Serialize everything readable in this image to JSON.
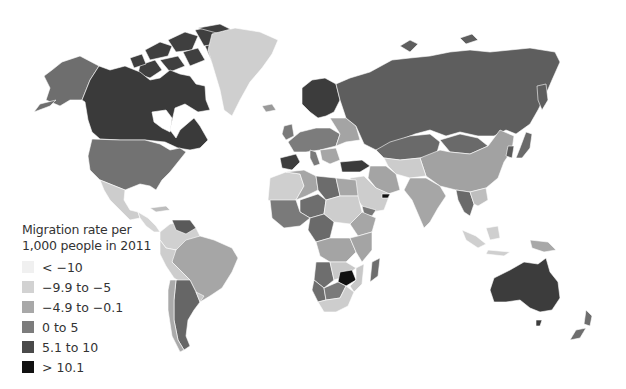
{
  "map": {
    "title": "Migration rate per 1,000 people in 2011",
    "type": "choropleth world map"
  },
  "legend": {
    "title_line1": "Migration rate per",
    "title_line2": "1,000 people in 2011",
    "items": [
      {
        "label": "< −10",
        "color": "#f0f0f0"
      },
      {
        "label": "−9.9 to −5",
        "color": "#d2d2d2"
      },
      {
        "label": "−4.9 to −0.1",
        "color": "#a8a8a8"
      },
      {
        "label": "0 to 5",
        "color": "#7c7c7c"
      },
      {
        "label": "5.1 to 10",
        "color": "#4a4a4a"
      },
      {
        "label": "> 10.1",
        "color": "#111111"
      }
    ]
  },
  "regions": [
    {
      "name": "Canada",
      "class": "5.1 to 10"
    },
    {
      "name": "Alaska (USA)",
      "class": "0 to 5"
    },
    {
      "name": "United States",
      "class": "0 to 5"
    },
    {
      "name": "Greenland",
      "class": "−9.9 to −5"
    },
    {
      "name": "Mexico",
      "class": "−9.9 to −5"
    },
    {
      "name": "Russia",
      "class": "0 to 5"
    },
    {
      "name": "China",
      "class": "−4.9 to −0.1"
    },
    {
      "name": "Australia",
      "class": "5.1 to 10"
    },
    {
      "name": "Brazil",
      "class": "−4.9 to −0.1"
    },
    {
      "name": "Argentina",
      "class": "0 to 5"
    },
    {
      "name": "Zimbabwe",
      "class": "> 10.1"
    },
    {
      "name": "United Arab Emirates",
      "class": "> 10.1"
    },
    {
      "name": "Spain",
      "class": "5.1 to 10"
    },
    {
      "name": "Scandinavia",
      "class": "5.1 to 10"
    }
  ]
}
